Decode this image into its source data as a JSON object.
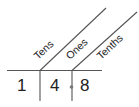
{
  "place_value_chart": {
    "headers": [
      "Tens",
      "Ones",
      "Tenths"
    ],
    "digits": [
      "1",
      "4",
      "8"
    ],
    "decimal_point": "decimal-dot",
    "number": "14.8"
  }
}
